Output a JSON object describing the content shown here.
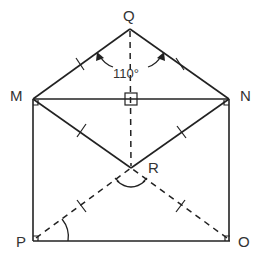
{
  "diagram": {
    "type": "geometry",
    "points": {
      "Q": {
        "label": "Q",
        "x": 130,
        "y": 29
      },
      "M": {
        "label": "M",
        "x": 33,
        "y": 99
      },
      "N": {
        "label": "N",
        "x": 229,
        "y": 99
      },
      "R": {
        "label": "R",
        "x": 131,
        "y": 168
      },
      "P": {
        "label": "P",
        "x": 33,
        "y": 241
      },
      "O": {
        "label": "O",
        "x": 230,
        "y": 241
      }
    },
    "angle_label": "110°",
    "solid_segments": [
      "QM",
      "QN",
      "MN",
      "MR",
      "NR",
      "MP",
      "NO",
      "PO"
    ],
    "dashed_segments": [
      "QR",
      "PR",
      "OR"
    ],
    "equal_tick_segments": [
      "QM",
      "QN",
      "MR",
      "NR",
      "PR",
      "OR"
    ],
    "right_angle_marks": [
      "M",
      "N",
      "P",
      "O",
      "QR⊥MN"
    ],
    "angle_arcs": [
      "PRO",
      "RPO"
    ],
    "stroke_color": "#222222"
  }
}
